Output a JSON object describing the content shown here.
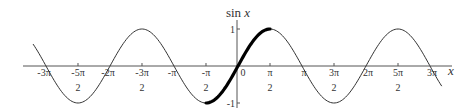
{
  "chart_data": {
    "type": "line",
    "title": "",
    "xlabel": "x",
    "ylabel": "sin x",
    "xlim": [
      -10.1,
      10.1
    ],
    "ylim": [
      -1,
      1
    ],
    "grid": false,
    "legend": null,
    "series": [
      {
        "name": "sin x",
        "function": "sin(x)",
        "x_range": [
          -10.06,
          10.0
        ],
        "style": "thin",
        "color": "#333333"
      },
      {
        "name": "sin x (restricted to [-π/2, π/2])",
        "function": "sin(x)",
        "x_range": [
          -1.5708,
          1.5708
        ],
        "style": "bold",
        "color": "#000000"
      }
    ],
    "x_ticks": [
      {
        "value": -9.4248,
        "num": "-3π",
        "den": ""
      },
      {
        "value": -7.854,
        "num": "-5π",
        "den": "2"
      },
      {
        "value": -6.2832,
        "num": "-2π",
        "den": ""
      },
      {
        "value": -4.7124,
        "num": "-3π",
        "den": "2"
      },
      {
        "value": -3.1416,
        "num": "-π",
        "den": ""
      },
      {
        "value": -1.5708,
        "num": "-π",
        "den": "2"
      },
      {
        "value": 0,
        "num": "0",
        "den": ""
      },
      {
        "value": 1.5708,
        "num": "π",
        "den": "2"
      },
      {
        "value": 3.1416,
        "num": "π",
        "den": ""
      },
      {
        "value": 4.7124,
        "num": "3π",
        "den": "2"
      },
      {
        "value": 6.2832,
        "num": "2π",
        "den": ""
      },
      {
        "value": 7.854,
        "num": "5π",
        "den": "2"
      },
      {
        "value": 9.4248,
        "num": "3π",
        "den": ""
      }
    ],
    "y_ticks": [
      {
        "value": 1,
        "label": "1"
      },
      {
        "value": -1,
        "label": "-1"
      }
    ]
  },
  "labels": {
    "y_axis_title_main": "sin ",
    "y_axis_title_var": "x",
    "x_axis_title": "x"
  },
  "colors": {
    "axis": "#555555",
    "curve": "#333333",
    "highlight": "#000000",
    "text": "#333333"
  }
}
